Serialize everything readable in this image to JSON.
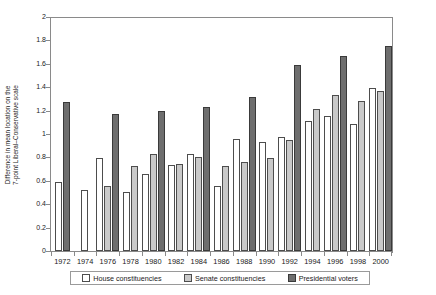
{
  "chart_data": {
    "type": "bar",
    "title": "",
    "xlabel": "",
    "ylabel": "Difference in mean location on the 7-point Liberal–Conservative scale",
    "ylabel_lines": [
      "Difference in mean location on the",
      "7-point Liberal–Conservative scale"
    ],
    "ylim": [
      0,
      2
    ],
    "ytick_step": 0.2,
    "ytick_labels": [
      "2",
      "1.8",
      "1.6",
      "1.4",
      "1.2",
      "1",
      "0.8",
      "0.6",
      "0.4",
      "0.2",
      "0"
    ],
    "grid": false,
    "legend_position": "bottom",
    "categories": [
      "1972",
      "1974",
      "1976",
      "1978",
      "1980",
      "1982",
      "1984",
      "1986",
      "1988",
      "1990",
      "1992",
      "1994",
      "1996",
      "1998",
      "2000"
    ],
    "series": [
      {
        "name": "House constituencies",
        "color": "#ffffff",
        "values": [
          0.59,
          0.52,
          0.8,
          0.51,
          0.66,
          0.74,
          0.83,
          0.56,
          0.96,
          0.94,
          0.98,
          1.12,
          1.16,
          1.09,
          1.4
        ]
      },
      {
        "name": "Senate constituencies",
        "color": "#c9c9c9",
        "values": [
          null,
          null,
          0.56,
          0.73,
          0.83,
          0.75,
          0.81,
          0.73,
          0.76,
          0.8,
          0.95,
          1.22,
          1.34,
          1.29,
          1.37
        ]
      },
      {
        "name": "Presidential voters",
        "color": "#6e6e6e",
        "values": [
          1.28,
          null,
          1.18,
          null,
          1.2,
          null,
          1.24,
          null,
          1.32,
          null,
          1.6,
          null,
          1.67,
          null,
          1.76
        ]
      }
    ]
  },
  "legend": {
    "items": [
      {
        "label": "House constituencies",
        "key": "house"
      },
      {
        "label": "Senate constituencies",
        "key": "senate"
      },
      {
        "label": "Presidential voters",
        "key": "pres"
      }
    ]
  },
  "colors": {
    "house": "#ffffff",
    "senate": "#c9c9c9",
    "presidential": "#6e6e6e",
    "axis": "#8a8a8a",
    "text": "#1a1a1a"
  }
}
